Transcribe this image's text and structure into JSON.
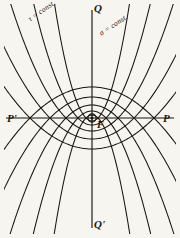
{
  "figure": {
    "background_color": "#f7f5ef",
    "ink_color": "#17150f",
    "labels": {
      "tau_const": "τ = const.",
      "sigma_const": "σ = const.",
      "axis_q_top": "Q",
      "axis_q_bottom": "Q'",
      "axis_p_left": "P'",
      "axis_p_right": "P",
      "focus": "F"
    },
    "focus_point": {
      "x": 92,
      "y": 118
    },
    "axes": {
      "horizontal": {
        "x1": 6,
        "y1": 118,
        "x2": 174,
        "y2": 118
      },
      "vertical": {
        "x1": 92,
        "y1": 10,
        "x2": 92,
        "y2": 228
      }
    },
    "families": [
      {
        "name": "tau = const.",
        "opens": "down",
        "semi_latus_rectum_values": [
          6,
          14,
          26,
          42,
          62
        ]
      },
      {
        "name": "sigma = const.",
        "opens": "up",
        "semi_latus_rectum_values": [
          6,
          14,
          26,
          42,
          62
        ]
      }
    ]
  }
}
